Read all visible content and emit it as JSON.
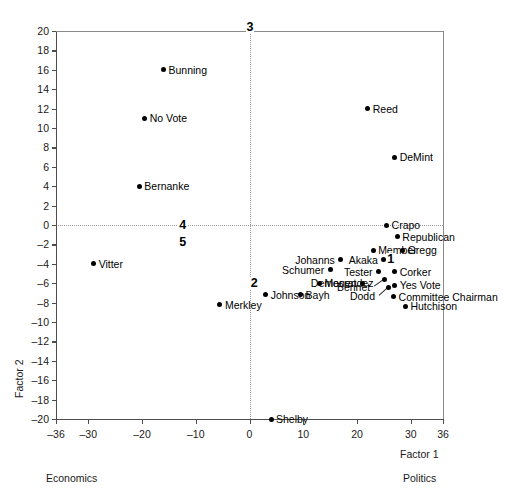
{
  "chart_data": {
    "type": "scatter",
    "title": "",
    "xlabel": "Factor 1",
    "ylabel": "Factor 2",
    "xlim": [
      -36,
      36
    ],
    "ylim": [
      -20,
      20
    ],
    "xticks": [
      -36,
      -30,
      -20,
      -10,
      0,
      10,
      20,
      30,
      36
    ],
    "xtick_labels": [
      "–36",
      "–30",
      "–20",
      "–10",
      "0",
      "10",
      "20",
      "30",
      "36"
    ],
    "yticks": [
      20,
      18,
      16,
      14,
      12,
      10,
      8,
      6,
      4,
      2,
      0,
      -2,
      -4,
      -6,
      -8,
      -10,
      -12,
      -14,
      -16,
      -18,
      -20
    ],
    "ytick_labels": [
      "20",
      "18",
      "16",
      "14",
      "12",
      "10",
      "8",
      "6",
      "4",
      "2",
      "0",
      "–2",
      "–4",
      "–6",
      "–8",
      "–10",
      "–12",
      "–14",
      "–16",
      "–18",
      "–20"
    ],
    "grid": "reference lines at x=0 and y=0 (dotted)",
    "gridlines": {
      "vertical_at_x": 0,
      "horizontal_at_y": 0
    },
    "legend": "none",
    "x_axis_low_caption": "Economics",
    "x_axis_high_caption": "Politics",
    "points": [
      {
        "label": "Bunning",
        "x": -16.0,
        "y": 16.0,
        "label_side": "right"
      },
      {
        "label": "No Vote",
        "x": -19.5,
        "y": 11.0,
        "label_side": "right"
      },
      {
        "label": "Bernanke",
        "x": -20.5,
        "y": 4.0,
        "label_side": "right"
      },
      {
        "label": "Vitter",
        "x": -29.0,
        "y": -4.0,
        "label_side": "right"
      },
      {
        "label": "Reed",
        "x": 22.0,
        "y": 12.0,
        "label_side": "right"
      },
      {
        "label": "DeMint",
        "x": 27.0,
        "y": 7.0,
        "label_side": "right"
      },
      {
        "label": "Crapo",
        "x": 25.5,
        "y": 0.0,
        "label_side": "right"
      },
      {
        "label": "Republican",
        "x": 27.5,
        "y": -1.2,
        "label_side": "right"
      },
      {
        "label": "Member",
        "x": 23.0,
        "y": -2.6,
        "label_side": "right"
      },
      {
        "label": "Gregg",
        "x": 28.5,
        "y": -2.6,
        "label_side": "right"
      },
      {
        "label": "Johanns",
        "x": 17.0,
        "y": -3.6,
        "label_side": "left"
      },
      {
        "label": "Akaka",
        "x": 25.0,
        "y": -3.6,
        "label_side": "left"
      },
      {
        "label": "Schumer",
        "x": 15.0,
        "y": -4.6,
        "label_side": "left"
      },
      {
        "label": "Tester",
        "x": 24.0,
        "y": -4.8,
        "label_side": "left"
      },
      {
        "label": "Corker",
        "x": 27.0,
        "y": -4.8,
        "label_side": "right"
      },
      {
        "label": "Democrat",
        "x": 21.0,
        "y": -6.0,
        "label_side": "left"
      },
      {
        "label": "Menendez",
        "x": 13.0,
        "y": -6.0,
        "label_side": "right"
      },
      {
        "label": "Yes Vote",
        "x": 27.0,
        "y": -6.2,
        "label_side": "right"
      },
      {
        "label": "Bennet",
        "x": 25.2,
        "y": -5.6,
        "label_side": "leader-left"
      },
      {
        "label": "Dodd",
        "x": 25.9,
        "y": -6.4,
        "label_side": "leader-left"
      },
      {
        "label": "Committee Chairman",
        "x": 26.8,
        "y": -7.4,
        "label_side": "right"
      },
      {
        "label": "Hutchison",
        "x": 29.0,
        "y": -8.4,
        "label_side": "right"
      },
      {
        "label": "Bayh",
        "x": 9.5,
        "y": -7.2,
        "label_side": "right"
      },
      {
        "label": "Johnson",
        "x": 3.0,
        "y": -7.2,
        "label_side": "right"
      },
      {
        "label": "Merkley",
        "x": -5.5,
        "y": -8.2,
        "label_side": "right"
      },
      {
        "label": "Shelby",
        "x": 4.0,
        "y": -20.0,
        "label_side": "right"
      }
    ],
    "cluster_annotations": [
      {
        "label": "3",
        "x": 0.0,
        "y": 20.4
      },
      {
        "label": "4",
        "x": -12.5,
        "y": 0.0
      },
      {
        "label": "5",
        "x": -12.5,
        "y": -1.8
      },
      {
        "label": "2",
        "x": 0.8,
        "y": -6.0
      },
      {
        "label": "1",
        "x": 26.2,
        "y": -3.5
      }
    ]
  },
  "labels": {
    "factor1": "Factor 1",
    "factor2": "Factor 2",
    "economics": "Economics",
    "politics": "Politics"
  },
  "colors": {
    "point": "#000000",
    "axis": "#4d4d4d",
    "grid": "#9a9a9a",
    "background": "#ffffff"
  }
}
